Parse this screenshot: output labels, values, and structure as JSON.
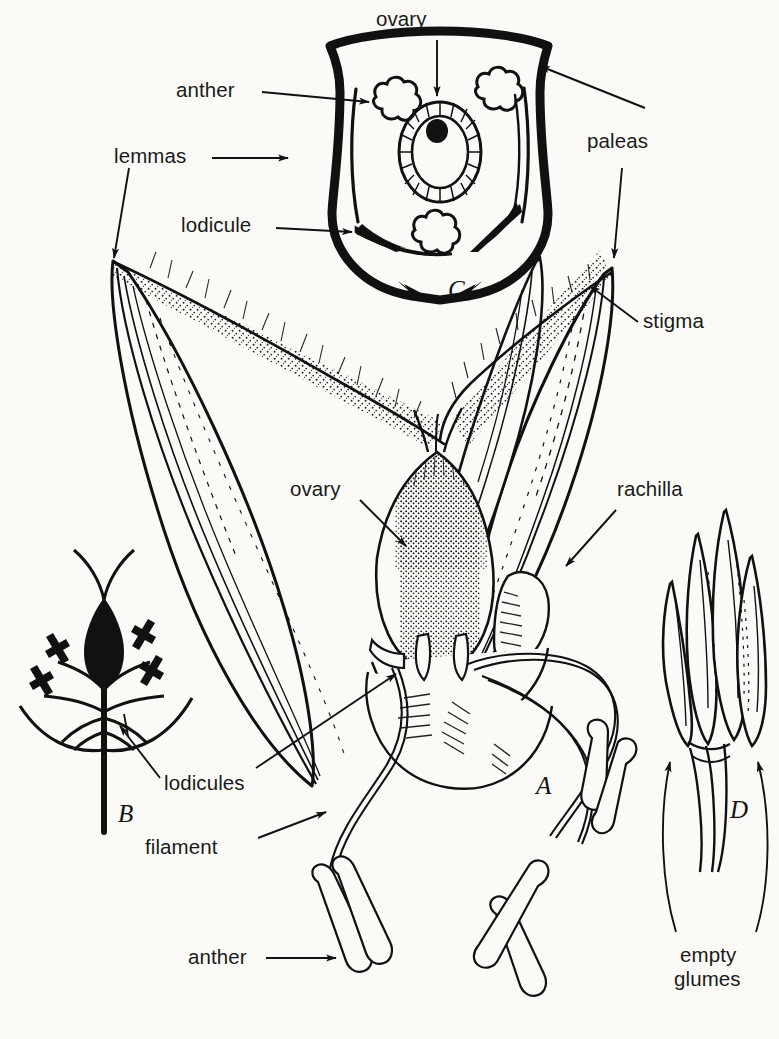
{
  "figure": {
    "ink_color": "#111111",
    "paper_color": "#fbfaf7",
    "labels": {
      "ovary_top": "ovary",
      "anther_top": "anther",
      "lemmas": "lemmas",
      "lodicule": "lodicule",
      "paleas": "paleas",
      "stigma": "stigma",
      "ovary_mid": "ovary",
      "rachilla": "rachilla",
      "lodicules": "lodicules",
      "filament": "filament",
      "anther_bottom": "anther",
      "empty_glumes_line1": "empty",
      "empty_glumes_line2": "glumes"
    },
    "panels": {
      "a": "A",
      "b": "B",
      "c": "C",
      "d": "D"
    }
  }
}
